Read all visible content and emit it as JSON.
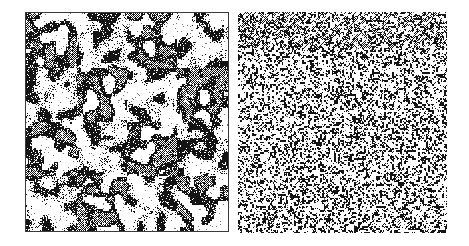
{
  "figure": {
    "type": "raster-panel-comparison",
    "background_color": "#ffffff",
    "width": 469,
    "height": 246,
    "panel_count": 2
  },
  "panels": [
    {
      "id": "correlated",
      "name": "spatial-pattern-correlated",
      "description": "Clustered spatially correlated random field with large contiguous blobs",
      "x": 25,
      "y": 12,
      "width": 204,
      "height": 220,
      "has_border": true,
      "border_color": "#3a3a3a",
      "cell_size": 2,
      "grid_cols": 101,
      "grid_rows": 109,
      "correlation": "high",
      "smoothing_passes": 7,
      "seed": 20250117,
      "tones": [
        {
          "label": "white",
          "color": "#ffffff",
          "fraction": 0.3,
          "dither": "none"
        },
        {
          "label": "mid-gray",
          "color": "#8c8c8c",
          "fraction": 0.42,
          "dither": "checker"
        },
        {
          "label": "dark",
          "color": "#2b2b2b",
          "fraction": 0.28,
          "dither": "dense"
        }
      ]
    },
    {
      "id": "uncorrelated",
      "name": "spatial-pattern-uncorrelated",
      "description": "Fine-grained uncorrelated salt-and-pepper white noise with no spatial structure",
      "x": 238,
      "y": 12,
      "width": 209,
      "height": 221,
      "has_border": false,
      "border_color": "#ffffff",
      "cell_size": 2,
      "grid_cols": 105,
      "grid_rows": 111,
      "correlation": "none",
      "smoothing_passes": 0,
      "seed": 77310244,
      "tones": [
        {
          "label": "white",
          "color": "#ffffff",
          "fraction": 0.34,
          "dither": "none"
        },
        {
          "label": "mid-gray",
          "color": "#8c8c8c",
          "fraction": 0.33,
          "dither": "checker"
        },
        {
          "label": "dark",
          "color": "#2b2b2b",
          "fraction": 0.33,
          "dither": "dense"
        }
      ]
    }
  ]
}
